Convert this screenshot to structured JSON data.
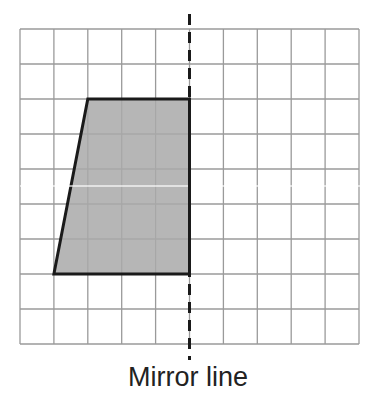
{
  "diagram": {
    "type": "reflection-grid",
    "grid": {
      "columns": 10,
      "rows": 9,
      "left": 20,
      "top": 29,
      "cell_w": 33.9,
      "cell_h": 35,
      "line_color": "#9a9a9a"
    },
    "shape": {
      "name": "trapezium",
      "vertices_grid": [
        [
          2,
          2
        ],
        [
          5,
          2
        ],
        [
          5,
          7
        ],
        [
          1,
          7
        ]
      ],
      "fill": "#a9a9a9",
      "stroke": "#1a1a1a"
    },
    "mirror_line": {
      "grid_x": 5,
      "y_start": 14,
      "y_end": 360,
      "style": "dashed",
      "color": "#1a1a1a"
    },
    "caption": "Mirror line"
  }
}
